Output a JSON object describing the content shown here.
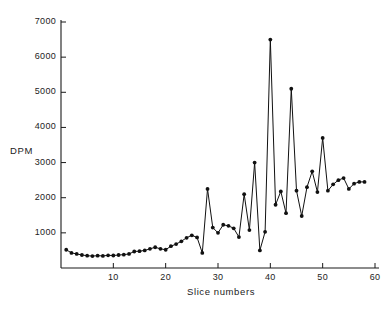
{
  "chart_data": {
    "type": "line",
    "title": "",
    "xlabel": "Slice numbers",
    "ylabel": "DPM",
    "xlim": [
      0,
      60
    ],
    "ylim": [
      0,
      7000
    ],
    "grid": false,
    "legend": null,
    "markers": "filled-circle",
    "line_color": "#111111",
    "xticks": [
      10,
      20,
      30,
      40,
      50,
      60
    ],
    "xtick_labels": [
      "10",
      "20",
      "30",
      "40",
      "50",
      "60"
    ],
    "yticks": [
      1000,
      2000,
      3000,
      4000,
      5000,
      6000,
      7000
    ],
    "ytick_labels": [
      "1000",
      "2000",
      "3000",
      "4000",
      "5000",
      "6000",
      "7000"
    ],
    "x": [
      1,
      2,
      3,
      4,
      5,
      6,
      7,
      8,
      9,
      10,
      11,
      12,
      13,
      14,
      15,
      16,
      17,
      18,
      19,
      20,
      21,
      22,
      23,
      24,
      25,
      26,
      27,
      28,
      29,
      30,
      31,
      32,
      33,
      34,
      35,
      36,
      37,
      38,
      39,
      40,
      41,
      42,
      43,
      44,
      45,
      46,
      47,
      48,
      49,
      50,
      51,
      52,
      53,
      54,
      55,
      56,
      57,
      58
    ],
    "values": [
      520,
      430,
      400,
      370,
      350,
      340,
      350,
      345,
      360,
      355,
      370,
      380,
      400,
      470,
      480,
      500,
      545,
      590,
      545,
      520,
      620,
      680,
      760,
      860,
      930,
      870,
      430,
      2250,
      1150,
      1000,
      1230,
      1200,
      1130,
      880,
      2100,
      1080,
      3000,
      500,
      1030,
      6500,
      1800,
      2180,
      1560,
      5100,
      2200,
      1480,
      2300,
      2750,
      2160,
      3700,
      2200,
      2380,
      2500,
      2560,
      2250,
      2400,
      2450,
      2450
    ],
    "series_name": "DPM per slice"
  },
  "axes": {
    "y_axis_name": "dpm-axis",
    "x_axis_name": "slice-number-axis"
  }
}
